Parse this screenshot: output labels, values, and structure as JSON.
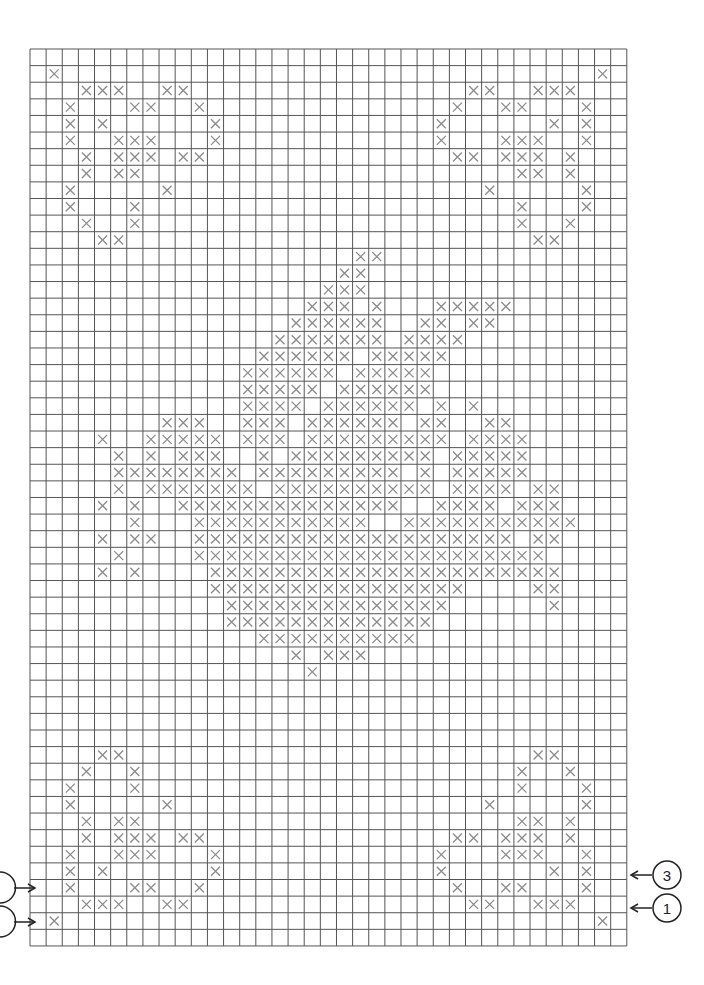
{
  "chart": {
    "grid": {
      "cols": 37,
      "rows": 54,
      "left": 30,
      "top": 49,
      "cell_w": 16.13,
      "cell_h": 16.61
    },
    "colors": {
      "grid": "#555555",
      "stitch": "#8a8a8a",
      "annotation": "#222222"
    },
    "stitches": {
      "1": [
        1,
        35
      ],
      "2": [
        3,
        4,
        5,
        8,
        9,
        27,
        28,
        31,
        32,
        33
      ],
      "3": [
        2,
        6,
        7,
        10,
        26,
        29,
        30,
        34
      ],
      "4": [
        2,
        4,
        11,
        25,
        32,
        34
      ],
      "5": [
        2,
        5,
        6,
        7,
        11,
        25,
        29,
        30,
        31,
        34
      ],
      "6": [
        3,
        5,
        6,
        7,
        9,
        10,
        26,
        27,
        29,
        30,
        31,
        33
      ],
      "7": [
        3,
        5,
        6,
        30,
        31,
        33
      ],
      "8": [
        2,
        8,
        28,
        34
      ],
      "9": [
        2,
        6,
        30,
        34
      ],
      "10": [
        3,
        6,
        30,
        33
      ],
      "11": [
        4,
        5,
        31,
        32
      ],
      "12": [
        20,
        21
      ],
      "13": [
        19,
        20
      ],
      "14": [
        18,
        19,
        20
      ],
      "15": [
        17,
        18,
        19,
        21,
        25,
        26,
        27,
        28,
        29
      ],
      "16": [
        16,
        17,
        18,
        19,
        20,
        21,
        24,
        25,
        27,
        28
      ],
      "17": [
        15,
        16,
        17,
        18,
        19,
        20,
        21,
        23,
        24,
        25,
        26
      ],
      "18": [
        14,
        15,
        16,
        17,
        18,
        19,
        21,
        22,
        23,
        24,
        25
      ],
      "19": [
        13,
        14,
        15,
        16,
        17,
        18,
        20,
        21,
        22,
        23,
        24
      ],
      "20": [
        13,
        14,
        15,
        16,
        17,
        19,
        20,
        21,
        22,
        23,
        24
      ],
      "21": [
        13,
        14,
        15,
        16,
        18,
        19,
        20,
        21,
        22,
        23,
        25,
        27
      ],
      "22": [
        8,
        9,
        10,
        13,
        14,
        15,
        17,
        18,
        19,
        20,
        21,
        22,
        24,
        25,
        28,
        29
      ],
      "23": [
        4,
        7,
        8,
        9,
        10,
        11,
        13,
        14,
        15,
        17,
        18,
        19,
        20,
        21,
        22,
        23,
        24,
        25,
        27,
        28,
        29,
        30
      ],
      "24": [
        5,
        7,
        9,
        10,
        11,
        14,
        16,
        17,
        18,
        19,
        20,
        21,
        22,
        23,
        24,
        26,
        27,
        28,
        29,
        30
      ],
      "25": [
        5,
        6,
        7,
        8,
        9,
        10,
        11,
        12,
        14,
        15,
        16,
        17,
        18,
        19,
        20,
        21,
        22,
        24,
        26,
        27,
        28,
        29,
        30
      ],
      "26": [
        5,
        7,
        8,
        9,
        10,
        11,
        12,
        13,
        15,
        16,
        17,
        18,
        19,
        20,
        21,
        22,
        23,
        24,
        26,
        27,
        28,
        29,
        31,
        32
      ],
      "27": [
        4,
        6,
        9,
        10,
        11,
        12,
        13,
        14,
        15,
        16,
        17,
        18,
        19,
        20,
        21,
        22,
        25,
        26,
        27,
        28,
        30,
        31,
        32
      ],
      "28": [
        6,
        10,
        11,
        12,
        13,
        14,
        15,
        16,
        17,
        18,
        19,
        20,
        23,
        24,
        25,
        26,
        27,
        28,
        29,
        30,
        31,
        32,
        33
      ],
      "29": [
        4,
        6,
        7,
        10,
        11,
        12,
        13,
        14,
        15,
        16,
        17,
        18,
        19,
        20,
        21,
        22,
        23,
        24,
        25,
        26,
        27,
        28,
        29,
        31,
        32
      ],
      "30": [
        5,
        10,
        11,
        12,
        13,
        14,
        15,
        16,
        17,
        18,
        19,
        20,
        21,
        22,
        23,
        24,
        25,
        26,
        27,
        28,
        29,
        30,
        31
      ],
      "31": [
        4,
        6,
        11,
        12,
        13,
        14,
        15,
        16,
        17,
        18,
        19,
        20,
        21,
        22,
        23,
        24,
        25,
        26,
        27,
        28,
        29,
        30,
        31,
        32
      ],
      "32": [
        11,
        12,
        13,
        14,
        15,
        16,
        17,
        18,
        19,
        20,
        21,
        22,
        23,
        24,
        25,
        26,
        31,
        32
      ],
      "33": [
        12,
        13,
        14,
        15,
        16,
        17,
        18,
        19,
        20,
        21,
        22,
        23,
        24,
        25,
        32
      ],
      "34": [
        12,
        13,
        14,
        15,
        16,
        17,
        18,
        19,
        20,
        21,
        22,
        23,
        24
      ],
      "35": [
        14,
        15,
        16,
        17,
        18,
        19,
        20,
        21,
        22,
        23
      ],
      "36": [
        16,
        18,
        19,
        20
      ],
      "37": [
        17
      ],
      "42": [
        4,
        5,
        31,
        32
      ],
      "43": [
        3,
        6,
        30,
        33
      ],
      "44": [
        2,
        6,
        30,
        34
      ],
      "45": [
        2,
        8,
        28,
        34
      ],
      "46": [
        3,
        5,
        6,
        30,
        31,
        33
      ],
      "47": [
        3,
        5,
        6,
        7,
        9,
        10,
        26,
        27,
        29,
        30,
        31,
        33
      ],
      "48": [
        2,
        5,
        6,
        7,
        11,
        25,
        29,
        30,
        31,
        34
      ],
      "49": [
        2,
        4,
        11,
        25,
        32,
        34
      ],
      "50": [
        2,
        6,
        7,
        10,
        26,
        29,
        30,
        34
      ],
      "51": [
        3,
        4,
        5,
        8,
        9,
        27,
        28,
        31,
        32,
        33
      ],
      "52": [
        1,
        35
      ]
    },
    "left_markers": [
      {
        "row_boundary": 50.5,
        "label": ""
      },
      {
        "row_boundary": 52.5,
        "label": ""
      }
    ],
    "right_markers": [
      {
        "y": 875,
        "label": "3"
      },
      {
        "y": 908,
        "label": "1"
      }
    ]
  }
}
